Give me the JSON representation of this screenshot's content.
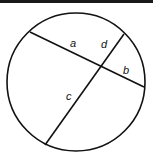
{
  "diagram": {
    "circle": {
      "cx": 76,
      "cy": 82,
      "r": 69,
      "stroke": "#111111"
    },
    "chords": [
      {
        "id": "chord-ab",
        "x1": 30,
        "y1": 32,
        "x2": 144,
        "y2": 87
      },
      {
        "id": "chord-cd",
        "x1": 124,
        "y1": 34,
        "x2": 45,
        "y2": 145
      }
    ],
    "labels": [
      {
        "id": "a",
        "text": "a",
        "x": 70,
        "y": 47
      },
      {
        "id": "d",
        "text": "d",
        "x": 101,
        "y": 48
      },
      {
        "id": "b",
        "text": "b",
        "x": 123,
        "y": 74
      },
      {
        "id": "c",
        "text": "c",
        "x": 66,
        "y": 100
      }
    ]
  }
}
